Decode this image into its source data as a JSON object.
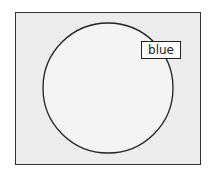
{
  "diagram": {
    "label": "blue",
    "colors": {
      "background": "#ffffff",
      "frame_fill": "#ececec",
      "frame_border": "#333333",
      "circle_fill": "#f3f3f3",
      "circle_stroke": "#222222",
      "label_fill": "#ffffff"
    }
  }
}
